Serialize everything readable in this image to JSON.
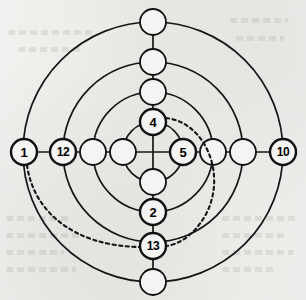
{
  "figure": {
    "type": "concentric-ring-node-diagram",
    "background_color": "#ececea",
    "ink_color": "#111111",
    "center": {
      "x": 153,
      "y": 152
    },
    "ring_radii": [
      30,
      60,
      90,
      130
    ],
    "node_radius": 13,
    "axes": [
      "up",
      "right",
      "down",
      "left"
    ]
  },
  "nodes": [
    {
      "id": "n-up-r1",
      "label": "4",
      "axis": "up",
      "ring": 1,
      "x": 153,
      "y": 122,
      "labeled": true
    },
    {
      "id": "n-up-r2",
      "label": "",
      "axis": "up",
      "ring": 2,
      "x": 153,
      "y": 92,
      "labeled": false
    },
    {
      "id": "n-up-r3",
      "label": "",
      "axis": "up",
      "ring": 3,
      "x": 153,
      "y": 62,
      "labeled": false
    },
    {
      "id": "n-up-r4",
      "label": "",
      "axis": "up",
      "ring": 4,
      "x": 153,
      "y": 22,
      "labeled": false
    },
    {
      "id": "n-right-r1",
      "label": "5",
      "axis": "right",
      "ring": 1,
      "x": 183,
      "y": 152,
      "labeled": true
    },
    {
      "id": "n-right-r2",
      "label": "",
      "axis": "right",
      "ring": 2,
      "x": 213,
      "y": 152,
      "labeled": false
    },
    {
      "id": "n-right-r3",
      "label": "",
      "axis": "right",
      "ring": 3,
      "x": 243,
      "y": 152,
      "labeled": false
    },
    {
      "id": "n-right-r4",
      "label": "10",
      "axis": "right",
      "ring": 4,
      "x": 283,
      "y": 152,
      "labeled": true
    },
    {
      "id": "n-down-r1",
      "label": "",
      "axis": "down",
      "ring": 1,
      "x": 153,
      "y": 182,
      "labeled": false
    },
    {
      "id": "n-down-r2",
      "label": "2",
      "axis": "down",
      "ring": 2,
      "x": 153,
      "y": 212,
      "labeled": true
    },
    {
      "id": "n-down-r3",
      "label": "13",
      "axis": "down",
      "ring": 3,
      "x": 153,
      "y": 246,
      "labeled": true
    },
    {
      "id": "n-down-r4",
      "label": "",
      "axis": "down",
      "ring": 4,
      "x": 153,
      "y": 282,
      "labeled": false
    },
    {
      "id": "n-left-r1",
      "label": "",
      "axis": "left",
      "ring": 1,
      "x": 123,
      "y": 152,
      "labeled": false
    },
    {
      "id": "n-left-r2",
      "label": "",
      "axis": "left",
      "ring": 2,
      "x": 93,
      "y": 152,
      "labeled": false
    },
    {
      "id": "n-left-r3",
      "label": "12",
      "axis": "left",
      "ring": 3,
      "x": 63,
      "y": 152,
      "labeled": true
    },
    {
      "id": "n-left-r4",
      "label": "1",
      "axis": "left",
      "ring": 4,
      "x": 24,
      "y": 152,
      "labeled": true
    }
  ],
  "dashed_arcs": [
    {
      "id": "arc-4-to-13",
      "from_node": "n-up-r1",
      "to_node": "n-down-r3",
      "path": "M 166 118 C 205 122 228 175 205 216 C 192 238 176 245 166 246"
    },
    {
      "id": "arc-1-to-13",
      "from_node": "n-left-r4",
      "to_node": "n-down-r3",
      "path": "M 27 165 C 33 210 72 246 140 247"
    }
  ],
  "labels_present": [
    "1",
    "2",
    "4",
    "5",
    "10",
    "12",
    "13"
  ],
  "label_count": 7,
  "node_count": 16
}
